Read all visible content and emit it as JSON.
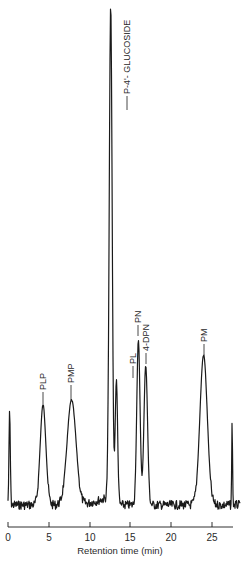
{
  "chart_data": {
    "type": "line",
    "title": "",
    "xlabel": "Retention time (min)",
    "ylabel": "",
    "xlim": [
      0,
      28
    ],
    "grid": false,
    "legend": "none",
    "x_ticks": [
      0,
      5,
      10,
      15,
      20,
      25
    ],
    "x_tick_labels": [
      "0",
      "5",
      "10",
      "15",
      "20",
      "25"
    ],
    "peaks": [
      {
        "label": "",
        "retention_time": 0.2,
        "relative_height": 0.19
      },
      {
        "label": "PLP",
        "retention_time": 4.3,
        "relative_height": 0.2
      },
      {
        "label": "PMP",
        "retention_time": 7.8,
        "relative_height": 0.21
      },
      {
        "label": "P-4'-GLUCOSIDE",
        "retention_time": 12.6,
        "relative_height": 1.0
      },
      {
        "label": "PL",
        "retention_time": 13.3,
        "relative_height": 0.25
      },
      {
        "label": "PN",
        "retention_time": 16.0,
        "relative_height": 0.33
      },
      {
        "label": "4-DPN",
        "retention_time": 16.9,
        "relative_height": 0.28
      },
      {
        "label": "PM",
        "retention_time": 24.0,
        "relative_height": 0.3
      },
      {
        "label": "",
        "retention_time": 27.5,
        "relative_height": 0.17
      }
    ],
    "annotations": [
      "PLP",
      "PMP",
      "P-4'-GLUCOSIDE",
      "PL",
      "PN",
      "4-DPN",
      "PM"
    ]
  },
  "axis": {
    "title": "Retention time (min)",
    "ticks": [
      "0",
      "5",
      "10",
      "15",
      "20",
      "25"
    ]
  },
  "labels": {
    "plp": "PLP",
    "pmp": "PMP",
    "glucoside": "P-4'- GLUCOSIDE",
    "pl": "PL",
    "pn": "PN",
    "dpn": "4-DPN",
    "pm": "PM"
  }
}
